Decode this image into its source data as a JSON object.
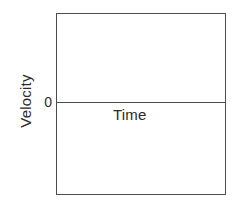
{
  "chart_data": {
    "type": "line",
    "title": "",
    "subtitle": "",
    "xlabel": "Time",
    "ylabel": "Velocity",
    "annotations": [
      {
        "text": "0",
        "role": "y-axis-zero-tick"
      }
    ],
    "tick_labels": {
      "y": [
        "0"
      ],
      "x": []
    },
    "series": [
      {
        "name": "zero-velocity-axis",
        "x": [
          0,
          1
        ],
        "values": [
          0,
          0
        ]
      }
    ],
    "axis_ranges": {
      "x": [
        0,
        1
      ],
      "y": [
        -1,
        1
      ]
    },
    "grid": false,
    "legend": null,
    "legend_position": "none"
  },
  "figure": {
    "axis_box": {
      "border_color": "#4d4d4d",
      "background_color": "#ffffff"
    },
    "zero_line": {
      "color": "#4d4d4d"
    },
    "text_color": "#2b2b2b",
    "labels": {
      "y_axis": "Velocity",
      "x_axis": "Time",
      "zero_tick": "0"
    }
  }
}
